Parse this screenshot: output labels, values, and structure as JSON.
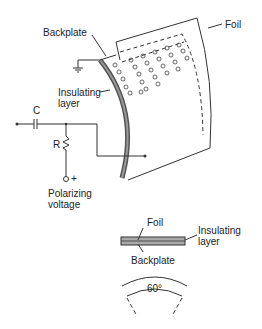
{
  "diagram": {
    "type": "electret/condenser microphone cross-section",
    "labels": {
      "foil_top": "Foil",
      "backplate_top": "Backplate",
      "insulating_top_line1": "Insulating",
      "insulating_top_line2": "layer",
      "capacitor": "C",
      "resistor": "R",
      "plus": "+",
      "polarizing_line1": "Polarizing",
      "polarizing_line2": "voltage",
      "foil_detail": "Foil",
      "insulating_detail_line1": "Insulating",
      "insulating_detail_line2": "layer",
      "backplate_detail": "Backplate",
      "angle": "60°"
    },
    "colors": {
      "line": "#333333",
      "text": "#222222",
      "background": "#ffffff",
      "layer_fill": "#888888"
    }
  }
}
